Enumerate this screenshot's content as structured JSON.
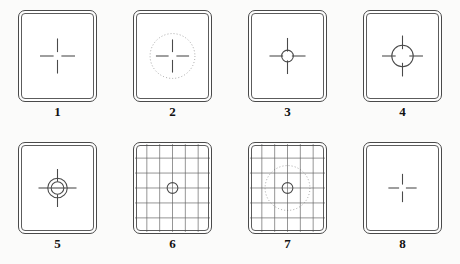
{
  "figure": {
    "type": "technical-illustration",
    "background_color": "#fbfbfa",
    "line_color": "#4a4a4a",
    "panel_count": 8,
    "columns": 4,
    "rows": 2
  },
  "panels": [
    {
      "number": "1",
      "name": "plain-matte-crosshair",
      "reticle": "cross-hair-gapped",
      "has_circle": false,
      "has_grid": false,
      "has_dotted_circle": false,
      "arm_length": 14,
      "center_gap": 8
    },
    {
      "number": "2",
      "name": "dotted-circle-crosshair",
      "reticle": "cross-hair-gapped",
      "has_circle": false,
      "has_grid": false,
      "has_dotted_circle": true,
      "dotted_circle_diameter": 46,
      "arm_length": 13,
      "center_gap": 8
    },
    {
      "number": "3",
      "name": "small-microprism-circle",
      "reticle": "cross-hair-gapped",
      "has_circle": true,
      "circle_diameter": 12,
      "has_grid": false,
      "has_dotted_circle": false,
      "arm_length": 14,
      "center_gap": 9
    },
    {
      "number": "4",
      "name": "large-microprism-circle",
      "reticle": "cross-hair-gapped",
      "has_circle": true,
      "circle_diameter": 22,
      "has_grid": false,
      "has_dotted_circle": false,
      "arm_length": 14,
      "center_gap": 14
    },
    {
      "number": "5",
      "name": "split-image-double-circle",
      "reticle": "cross-hair-gapped",
      "has_circle": true,
      "circle_diameter": 20,
      "inner_circle_diameter": 13,
      "split_line": true,
      "has_grid": false,
      "has_dotted_circle": false,
      "arm_length": 13,
      "center_gap": 13
    },
    {
      "number": "6",
      "name": "grid-screen-with-circle",
      "reticle": "grid",
      "has_circle": true,
      "circle_diameter": 11,
      "has_grid": true,
      "grid_columns": 6,
      "grid_rows": 6,
      "has_dotted_circle": false
    },
    {
      "number": "7",
      "name": "grid-screen-dotted-circle",
      "reticle": "grid",
      "has_circle": true,
      "circle_diameter": 11,
      "has_grid": true,
      "grid_columns": 6,
      "grid_rows": 6,
      "has_dotted_circle": true,
      "dotted_circle_diameter": 46
    },
    {
      "number": "8",
      "name": "fine-matte-crosshair",
      "reticle": "cross-hair-gapped",
      "has_circle": false,
      "has_grid": false,
      "has_dotted_circle": false,
      "arm_length": 11,
      "center_gap": 7
    }
  ]
}
